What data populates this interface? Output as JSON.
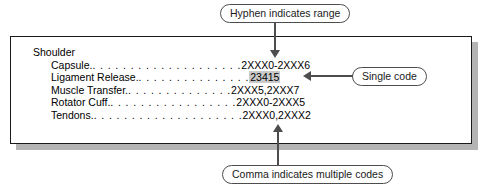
{
  "figure": {
    "panel": {
      "section_title": "Shoulder",
      "entries": [
        {
          "label": "Capsule.",
          "leader": ". . . . . . . . . . . . . . . . . . . .",
          "codes": "2XXX0-2XXX6"
        },
        {
          "label": "Ligament Release.",
          "leader": ". . . . . . . . . . . . . . .",
          "codes": "23415"
        },
        {
          "label": "Muscle Transfer.",
          "leader": ". . . . . . . . . . . . . .",
          "codes": "2XXX5,2XXX7"
        },
        {
          "label": "Rotator Cuff.",
          "leader": ". . . . . . . . . . . . . . . . .",
          "codes": "2XXX0-2XXX5"
        },
        {
          "label": "Tendons.",
          "leader": ". . . . . . . . . . . . . . . . . . . .",
          "codes": "2XXX0,2XXX2"
        }
      ]
    },
    "callouts": {
      "hyphen": "Hyphen indicates range",
      "single": "Single code",
      "comma": "Comma indicates multiple codes"
    },
    "colors": {
      "highlight": "#c9c9c9",
      "line": "#4d4d4d",
      "border": "#1a1a1a",
      "shadow": "#b4b4b4"
    }
  }
}
